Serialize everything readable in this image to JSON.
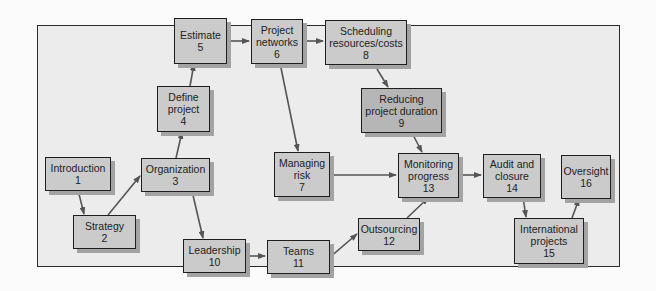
{
  "diagram": {
    "type": "flowchart",
    "colors": {
      "frame_background": "#ececec",
      "box_fill": "#cbcbcb",
      "box_fill_highlight": "#b6b6b6",
      "box_border": "#1e1e1e",
      "shadow": "#a3a3a3",
      "arrow": "#555555"
    },
    "nodes": [
      {
        "id": 1,
        "label": "Introduction",
        "label2": "",
        "num": "1"
      },
      {
        "id": 2,
        "label": "Strategy",
        "label2": "",
        "num": "2"
      },
      {
        "id": 3,
        "label": "Organization",
        "label2": "",
        "num": "3"
      },
      {
        "id": 4,
        "label": "Define",
        "label2": "project",
        "num": "4"
      },
      {
        "id": 5,
        "label": "Estimate",
        "label2": "",
        "num": "5"
      },
      {
        "id": 6,
        "label": "Project",
        "label2": "networks",
        "num": "6"
      },
      {
        "id": 7,
        "label": "Managing",
        "label2": "risk",
        "num": "7"
      },
      {
        "id": 8,
        "label": "Scheduling",
        "label2": "resources/costs",
        "num": "8"
      },
      {
        "id": 9,
        "label": "Reducing",
        "label2": "project duration",
        "num": "9"
      },
      {
        "id": 10,
        "label": "Leadership",
        "label2": "",
        "num": "10"
      },
      {
        "id": 11,
        "label": "Teams",
        "label2": "",
        "num": "11"
      },
      {
        "id": 12,
        "label": "Outsourcing",
        "label2": "",
        "num": "12"
      },
      {
        "id": 13,
        "label": "Monitoring",
        "label2": "progress",
        "num": "13"
      },
      {
        "id": 14,
        "label": "Audit and",
        "label2": "closure",
        "num": "14"
      },
      {
        "id": 15,
        "label": "International",
        "label2": "projects",
        "num": "15"
      },
      {
        "id": 16,
        "label": "Oversight",
        "label2": "",
        "num": "16"
      }
    ],
    "edges": [
      [
        1,
        2
      ],
      [
        2,
        3
      ],
      [
        3,
        4
      ],
      [
        4,
        5
      ],
      [
        5,
        6
      ],
      [
        6,
        8
      ],
      [
        6,
        7
      ],
      [
        8,
        9
      ],
      [
        9,
        13
      ],
      [
        3,
        10
      ],
      [
        10,
        11
      ],
      [
        11,
        12
      ],
      [
        12,
        13
      ],
      [
        7,
        13
      ],
      [
        13,
        14
      ],
      [
        14,
        15
      ],
      [
        15,
        16
      ]
    ]
  }
}
